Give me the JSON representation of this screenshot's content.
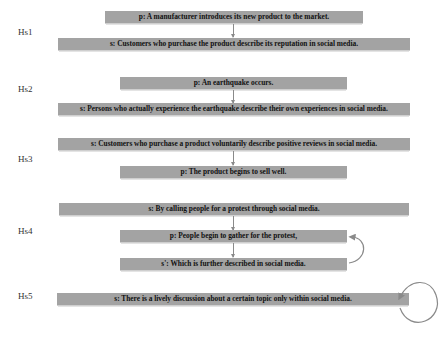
{
  "hypotheses": [
    {
      "label": "Hs1",
      "boxes": [
        "p: A manufacturer introduces its new product to the market.",
        "s: Customers who purchase the product describe its reputation in social media."
      ]
    },
    {
      "label": "Hs2",
      "boxes": [
        "p: An earthquake occurs.",
        "s: Persons who actually experience the earthquake describe their own experiences in social media."
      ]
    },
    {
      "label": "Hs3",
      "boxes": [
        "s: Customers who purchase a product voluntarily describe positive reviews in social media.",
        "p: The product begins to sell well."
      ]
    },
    {
      "label": "Hs4",
      "boxes": [
        "s: By calling people for a protest through social media.",
        "p: People begin to gather for the protest,",
        "s': Which is further described in social media."
      ]
    },
    {
      "label": "Hs5",
      "boxes": [
        "s: There is a lively discussion about a certain topic only within social media."
      ]
    }
  ],
  "colors": {
    "box_fill": "#a3a3a3",
    "arrow": "#8a8a8a",
    "text": "#111111"
  }
}
